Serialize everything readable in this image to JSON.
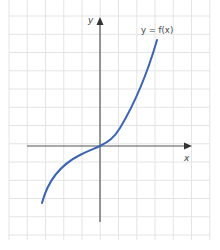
{
  "chart_data": {
    "type": "line",
    "title": "",
    "xlabel": "x",
    "ylabel": "y",
    "grid": true,
    "legend": "none",
    "annotations": [
      "y = f(x)"
    ],
    "series": [
      {
        "name": "y = f(x)",
        "color": "#3c64b4",
        "x": [
          -3.2,
          -2.5,
          -2,
          -1.5,
          -1,
          -0.5,
          0,
          0.5,
          1,
          1.5,
          2,
          2.5,
          3.1
        ],
        "y": [
          -3.1,
          -2.0,
          -1.5,
          -1.05,
          -0.7,
          -0.35,
          0,
          0.35,
          0.9,
          1.8,
          3.0,
          4.6,
          5.8
        ]
      }
    ],
    "axis_ranges": {
      "x": [
        -5,
        5
      ],
      "y": [
        -4,
        7
      ]
    }
  },
  "labels": {
    "x_axis": "x",
    "y_axis": "y",
    "function": "y = f(x)"
  },
  "colors": {
    "curve": "#3c64b4",
    "axis": "#555555",
    "grid": "#e4e4e4"
  }
}
